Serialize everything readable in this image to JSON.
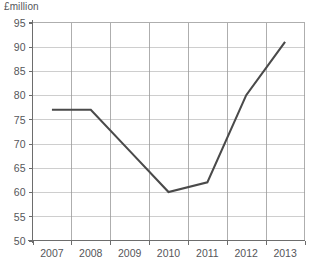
{
  "chart_data": {
    "type": "line",
    "title": "",
    "ylabel": "£million",
    "xlabel": "",
    "categories": [
      "2007",
      "2008",
      "2009",
      "2010",
      "2011",
      "2012",
      "2013"
    ],
    "values": [
      77,
      77,
      68.5,
      60,
      62,
      80,
      91
    ],
    "series": [
      {
        "name": "",
        "values": [
          77,
          77,
          68.5,
          60,
          62,
          80,
          91
        ],
        "color": "#4a4a4a"
      }
    ],
    "ylim": [
      50,
      95
    ],
    "ytick_labels": [
      "95",
      "90",
      "85",
      "80",
      "75",
      "70",
      "65",
      "60",
      "55",
      "50"
    ],
    "ytick_values": [
      95,
      90,
      85,
      80,
      75,
      70,
      65,
      60,
      55,
      50
    ],
    "xtick_labels": [
      "2007",
      "2008",
      "2009",
      "2010",
      "2011",
      "2012",
      "2013"
    ],
    "grid": true,
    "legend": false,
    "legend_position": "none"
  },
  "axis": {
    "y_title": "£million"
  },
  "colors": {
    "series_line": "#4a4a4a",
    "grid": "#b9b9b9",
    "grid_vertical": "#9a9a9a",
    "axis": "#6d6d6d",
    "text": "#55565a",
    "background": "#ffffff"
  }
}
